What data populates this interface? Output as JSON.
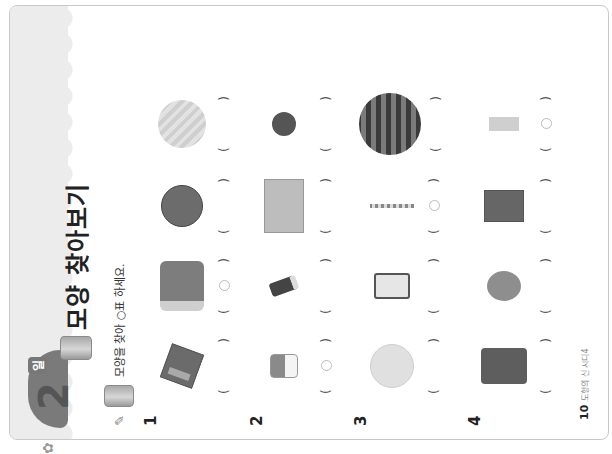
{
  "header": {
    "day_number": "2",
    "day_suffix": "일",
    "title": "모양 찾아보기",
    "title_shape_icon": "cylinder-icon"
  },
  "instruction": {
    "icon": "pencil-icon",
    "shape_icon": "cylinder-icon",
    "text": "모양을 찾아 ○표 하세요."
  },
  "questions": [
    {
      "number": "1",
      "items": [
        {
          "name": "gift-box",
          "marked": false
        },
        {
          "name": "drum",
          "marked": true
        },
        {
          "name": "basketball",
          "marked": false
        },
        {
          "name": "melon",
          "marked": false
        }
      ]
    },
    {
      "number": "2",
      "items": [
        {
          "name": "cylinder-container",
          "marked": true
        },
        {
          "name": "eraser",
          "marked": false
        },
        {
          "name": "cardboard-box",
          "marked": false
        },
        {
          "name": "ball",
          "marked": false
        }
      ]
    },
    {
      "number": "3",
      "items": [
        {
          "name": "volleyball",
          "marked": false
        },
        {
          "name": "smartphone",
          "marked": false
        },
        {
          "name": "straw",
          "marked": true
        },
        {
          "name": "watermelon",
          "marked": false
        }
      ]
    },
    {
      "number": "4",
      "items": [
        {
          "name": "calculator",
          "marked": false
        },
        {
          "name": "balloon",
          "marked": false
        },
        {
          "name": "book",
          "marked": false
        },
        {
          "name": "tape-roll",
          "marked": true
        }
      ]
    }
  ],
  "paren_open": "(",
  "paren_close": ")",
  "footer": {
    "page_number": "10",
    "book_title": "도형의 신 시디4"
  },
  "colors": {
    "header_band": "#ececec",
    "badge": "#7a7a7a",
    "mark": "#bbbbbb"
  }
}
